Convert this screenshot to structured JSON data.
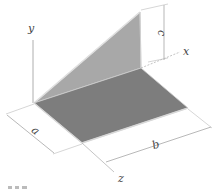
{
  "diagram": {
    "type": "3d-geometry",
    "axes": {
      "x": "x",
      "y": "y",
      "z": "z"
    },
    "dimensions": {
      "a": "a",
      "b": "b",
      "c": "c"
    },
    "caption_partial": "",
    "colors": {
      "floor": "#7d7d7d",
      "triangle": "#a8a8a8",
      "edge_highlight": "#d8d8d8",
      "lines": "#888888"
    }
  }
}
